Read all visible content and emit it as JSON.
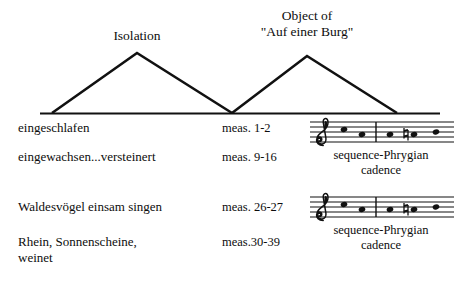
{
  "diagram": {
    "arches": [
      {
        "id": "isolation",
        "label_lines": [
          "Isolation"
        ],
        "base_left_x": 52,
        "apex_x": 137,
        "base_right_x": 232,
        "apex_y": 53,
        "base_y": 113
      },
      {
        "id": "object-auf-einer-burg",
        "label_lines": [
          "Object of",
          "\"Auf einer Burg\""
        ],
        "base_left_x": 232,
        "apex_x": 307,
        "base_right_x": 397,
        "apex_y": 56,
        "base_y": 113
      }
    ],
    "baseline": {
      "x1": 40,
      "x2": 440,
      "y": 113
    },
    "stroke_color": "#111111"
  },
  "rows": [
    {
      "phrase_line1": "eingeschlafen",
      "phrase_line2": "",
      "measures": "meas. 1-2"
    },
    {
      "phrase_line1": "eingewachsen...versteinert",
      "phrase_line2": "",
      "measures": "meas. 9-16"
    },
    {
      "phrase_line1": "Waldesvögel einsam singen",
      "phrase_line2": "",
      "measures": "meas. 26-27"
    },
    {
      "phrase_line1": "Rhein, Sonnenscheine,",
      "phrase_line2": "weinet",
      "measures": "meas.30-39"
    }
  ],
  "staves": [
    {
      "id": "staff-upper",
      "clef": "treble-clef",
      "caption_line1": "sequence-Phrygian",
      "caption_line2": "cadence",
      "notes": [
        {
          "index": 1,
          "x": 38,
          "staff_position": 5,
          "accidental": ""
        },
        {
          "index": 2,
          "x": 56,
          "staff_position": 3,
          "accidental": ""
        },
        {
          "index": 3,
          "x": 84,
          "staff_position": 3,
          "accidental": ""
        },
        {
          "index": 4,
          "x": 106,
          "staff_position": 3,
          "accidental": "natural"
        },
        {
          "index": 5,
          "x": 128,
          "staff_position": 4,
          "accidental": ""
        }
      ],
      "barline_x": 70
    },
    {
      "id": "staff-lower",
      "clef": "treble-clef",
      "caption_line1": "sequence-Phrygian",
      "caption_line2": "cadence",
      "notes": [
        {
          "index": 1,
          "x": 38,
          "staff_position": 5,
          "accidental": ""
        },
        {
          "index": 2,
          "x": 56,
          "staff_position": 3,
          "accidental": ""
        },
        {
          "index": 3,
          "x": 84,
          "staff_position": 3,
          "accidental": ""
        },
        {
          "index": 4,
          "x": 106,
          "staff_position": 3,
          "accidental": "natural"
        },
        {
          "index": 5,
          "x": 128,
          "staff_position": 4,
          "accidental": ""
        }
      ],
      "barline_x": 70
    }
  ]
}
